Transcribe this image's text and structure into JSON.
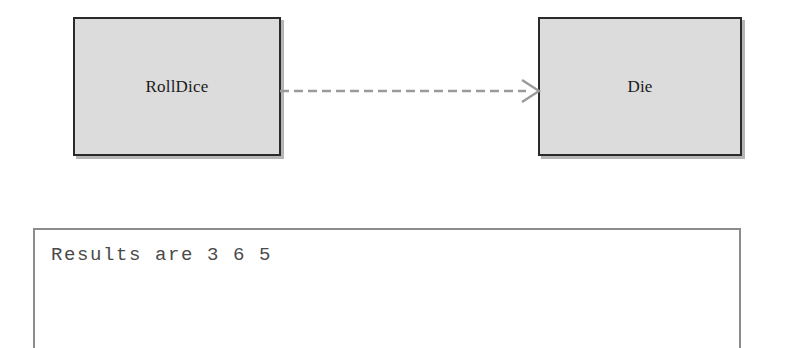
{
  "diagram": {
    "type": "uml-class-diagram",
    "classes": [
      {
        "name": "RollDice"
      },
      {
        "name": "Die"
      }
    ],
    "relationships": [
      {
        "kind": "dependency",
        "from": "RollDice",
        "to": "Die",
        "line_style": "dashed",
        "arrowhead": "open",
        "color": "#9a9a9a"
      }
    ],
    "colors": {
      "box_fill": "#dcdcdc",
      "box_border": "#2a2a2a",
      "shadow": "#787878",
      "connector": "#9a9a9a",
      "background": "#ffffff"
    }
  },
  "console": {
    "output_line": "Results are 3 6 5",
    "border_color": "#8c8c8c",
    "text_color": "#4a4a4a"
  }
}
